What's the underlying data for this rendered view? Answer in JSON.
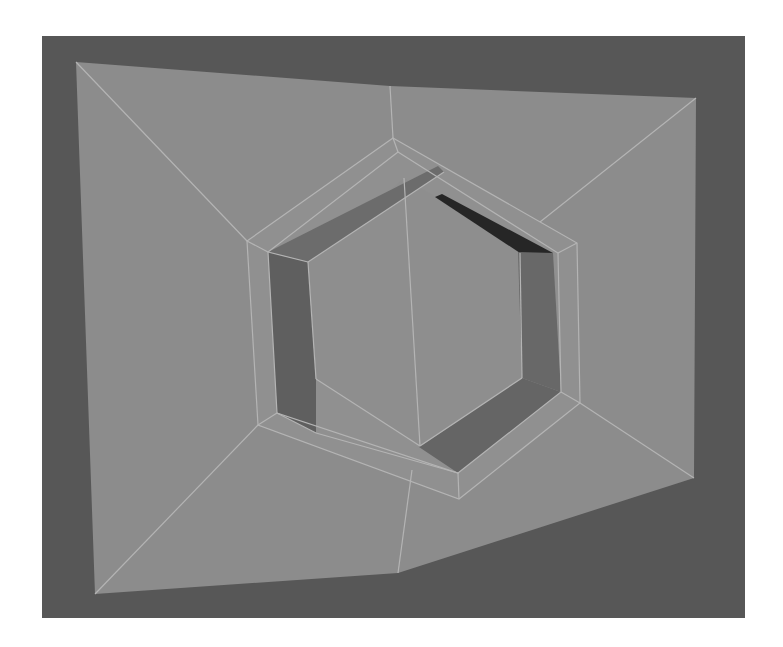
{
  "scene": {
    "type": "3d-mesh-viewport",
    "description": "Plane with hexagonal inset recess, wireframe overlay",
    "colors": {
      "background": "#ffffff",
      "viewport": "#575757",
      "plane_face": "#8c8c8c",
      "rim_face": "#909090",
      "wall_light": "#6e6e6e",
      "wall_mid": "#636363",
      "wall_dark": "#262626",
      "wall_bottom": "#656565",
      "floor_face": "#8e8e8e",
      "edge": "#b4b4b4"
    }
  }
}
